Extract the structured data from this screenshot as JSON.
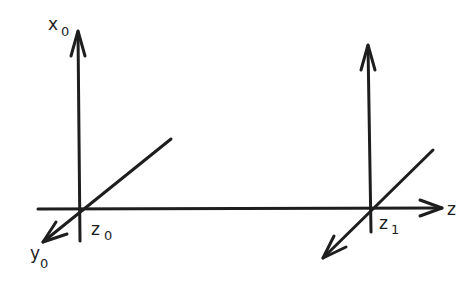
{
  "diagram": {
    "type": "coordinate-frames",
    "stroke_color": "#1e1e1e",
    "background": "#ffffff",
    "frames": [
      {
        "origin_label": {
          "main": "z",
          "sub": "0"
        },
        "axis_up_label": {
          "main": "x",
          "sub": "0"
        },
        "axis_diag_label": {
          "main": "y",
          "sub": "0"
        }
      },
      {
        "origin_label": {
          "main": "z",
          "sub": "1"
        }
      }
    ],
    "z_axis_label": "z"
  }
}
